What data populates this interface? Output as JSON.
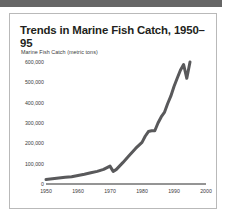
{
  "figure": {
    "title": "Trends in Marine Fish Catch, 1950–95",
    "border_color": "#b9b9b9",
    "band_color": "#666666",
    "background": "#ffffff"
  },
  "chart_data": {
    "type": "line",
    "title": "Trends in Marine Fish Catch, 1950–95",
    "xlabel": "",
    "ylabel": "Marine Fish Catch (metric tons)",
    "line_color": "#59595b",
    "line_width": 3,
    "grid": false,
    "legend": null,
    "xlim": [
      1950,
      2000
    ],
    "ylim": [
      0,
      620000
    ],
    "xticks": [
      1950,
      1960,
      1970,
      1980,
      1990,
      2000
    ],
    "xtick_labels": [
      "1950",
      "1960",
      "1970",
      "1980",
      "1990",
      "2000"
    ],
    "yticks": [
      0,
      100000,
      200000,
      300000,
      400000,
      500000,
      600000
    ],
    "ytick_labels": [
      "0",
      "100,000",
      "200,000",
      "300,000",
      "400,000",
      "500,000",
      "600,000"
    ],
    "x": [
      1950,
      1952,
      1954,
      1956,
      1958,
      1960,
      1962,
      1964,
      1966,
      1968,
      1970,
      1971,
      1972,
      1974,
      1976,
      1978,
      1980,
      1981,
      1982,
      1983,
      1984,
      1985,
      1986,
      1987,
      1988,
      1989,
      1990,
      1991,
      1992,
      1993,
      1994,
      1995
    ],
    "values": [
      22000,
      26000,
      30000,
      33000,
      36000,
      42000,
      48000,
      55000,
      62000,
      72000,
      88000,
      62000,
      72000,
      105000,
      140000,
      175000,
      205000,
      235000,
      258000,
      262000,
      262000,
      300000,
      330000,
      352000,
      395000,
      432000,
      480000,
      520000,
      560000,
      588000,
      520000,
      600000
    ],
    "annotations": []
  }
}
